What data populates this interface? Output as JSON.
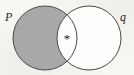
{
  "figure": {
    "type": "venn-diagram",
    "background_color": "#f7f6f3",
    "stroke_color": "#4a4947",
    "shade_color": "#a8a8a8",
    "unshaded_color": "#fdfdfb",
    "text_color": "#201f1d"
  },
  "sets": {
    "left": {
      "label": "P",
      "label_name": "set-label-p",
      "fill": "shaded",
      "fill_color": "#a8a8a8",
      "cx": 45,
      "cy": 38,
      "r": 32
    },
    "right": {
      "label": "q",
      "label_name": "set-label-q",
      "fill": "unshaded",
      "fill_color": "#fdfdfb",
      "cx": 89,
      "cy": 38,
      "r": 32
    }
  },
  "regions": {
    "left_only": {
      "name": "p-only-region",
      "state": "shaded",
      "color": "#a8a8a8"
    },
    "intersection": {
      "name": "intersection-region",
      "state": "unshaded",
      "color": "#fdfdfb",
      "marker": "*",
      "marker_name": "asterisk-marker",
      "marker_x": 67,
      "marker_y": 39
    },
    "right_only": {
      "name": "q-only-region",
      "state": "unshaded",
      "color": "#fdfdfb"
    }
  }
}
